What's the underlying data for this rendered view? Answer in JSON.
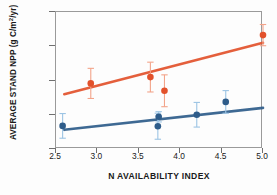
{
  "chart_data": {
    "type": "scatter",
    "title": "",
    "xlabel": "N AVAILABILITY INDEX",
    "ylabel": "AVERAGE STAND NPP (g C/m2/yr)",
    "ylabel_parts": {
      "prefix": "AVERAGE STAND NPP (g C/m",
      "sup": "2",
      "suffix": "/yr)"
    },
    "xlim": [
      2.5,
      5.0
    ],
    "ylim": [
      800,
      1600
    ],
    "xticks": [
      2.5,
      3.0,
      3.5,
      4.0,
      4.5,
      5.0
    ],
    "xtick_labels": [
      "2.5",
      "3.0",
      "3.5",
      "4.0",
      "4.5",
      "5.0"
    ],
    "yticks": [
      800,
      1000,
      1200,
      1400,
      1600
    ],
    "ytick_labels": [
      "800",
      "1000",
      "1200",
      "1400",
      "1600"
    ],
    "grid": false,
    "legend": "none",
    "series": [
      {
        "name": "upper-series",
        "color": "#E2512B",
        "errorbar_color": "#F3A48A",
        "points": [
          {
            "x": 2.92,
            "y": 1183,
            "yerr": 88
          },
          {
            "x": 3.64,
            "y": 1220,
            "yerr": 87
          },
          {
            "x": 3.81,
            "y": 1140,
            "yerr": 93
          },
          {
            "x": 5.0,
            "y": 1465,
            "yerr": 62
          }
        ],
        "trendline": {
          "x0": 2.6,
          "y0": 1120,
          "x1": 5.0,
          "y1": 1420
        }
      },
      {
        "name": "lower-series",
        "color": "#2E5C8A",
        "errorbar_color": "#9CC4E4",
        "points": [
          {
            "x": 2.58,
            "y": 935,
            "yerr": 72
          },
          {
            "x": 3.73,
            "y": 933,
            "yerr": 76
          },
          {
            "x": 3.74,
            "y": 988,
            "yerr": 30
          },
          {
            "x": 4.2,
            "y": 1000,
            "yerr": 72
          },
          {
            "x": 4.55,
            "y": 1075,
            "yerr": 66
          }
        ],
        "trendline": {
          "x0": 2.6,
          "y0": 912,
          "x1": 5.0,
          "y1": 1040
        }
      }
    ]
  }
}
